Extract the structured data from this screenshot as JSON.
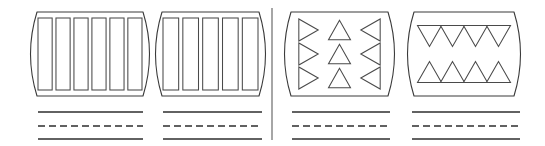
{
  "figure": {
    "title": "Four patterned barrel panels with caption rules",
    "canvas": {
      "width": 545,
      "height": 146
    },
    "background_color": "#ffffff",
    "outline_color": "#3a3a3a",
    "inner_shape_color": "#4a4a4a",
    "rule_color": "#2e2e2e",
    "divider_color": "#6b6b6b"
  },
  "divider": {
    "name": "center-divider",
    "orientation": "vertical",
    "x": 272,
    "y_start": 8,
    "y_end": 140
  },
  "groups": [
    {
      "id": "group-1",
      "panel": {
        "name": "barrel-panel-vertical-bars-six",
        "left": 33,
        "right": 147,
        "top": 12,
        "bottom": 96,
        "bulge": 9,
        "pattern": "vertical-bars",
        "count": 6
      },
      "rules": [
        {
          "style": "solid",
          "x1": 38,
          "x2": 143,
          "y": 112
        },
        {
          "style": "dashed",
          "x1": 38,
          "x2": 143,
          "y": 126
        },
        {
          "style": "solid",
          "x1": 38,
          "x2": 143,
          "y": 139
        }
      ]
    },
    {
      "id": "group-2",
      "panel": {
        "name": "barrel-panel-vertical-bars-five",
        "left": 158,
        "right": 263,
        "top": 12,
        "bottom": 96,
        "bulge": 9,
        "pattern": "vertical-bars",
        "count": 5
      },
      "rules": [
        {
          "style": "solid",
          "x1": 163,
          "x2": 262,
          "y": 112
        },
        {
          "style": "dashed",
          "x1": 163,
          "x2": 262,
          "y": 126
        },
        {
          "style": "solid",
          "x1": 163,
          "x2": 262,
          "y": 139
        }
      ]
    },
    {
      "id": "group-3",
      "panel": {
        "name": "barrel-panel-triangles-three-columns",
        "left": 287,
        "right": 392,
        "top": 12,
        "bottom": 96,
        "bulge": 9,
        "pattern": "triangle-columns",
        "columns": [
          {
            "direction": "right",
            "count": 3
          },
          {
            "direction": "up",
            "count": 3
          },
          {
            "direction": "left",
            "count": 3
          }
        ]
      },
      "rules": [
        {
          "style": "solid",
          "x1": 292,
          "x2": 390,
          "y": 112
        },
        {
          "style": "dashed",
          "x1": 292,
          "x2": 390,
          "y": 126
        },
        {
          "style": "solid",
          "x1": 292,
          "x2": 390,
          "y": 139
        }
      ]
    },
    {
      "id": "group-4",
      "panel": {
        "name": "barrel-panel-triangles-two-rows",
        "left": 410,
        "right": 518,
        "top": 12,
        "bottom": 96,
        "bulge": 9,
        "pattern": "triangle-rows",
        "rows": [
          {
            "direction": "down",
            "count": 4
          },
          {
            "direction": "up",
            "count": 4
          }
        ]
      },
      "rules": [
        {
          "style": "solid",
          "x1": 412,
          "x2": 520,
          "y": 112
        },
        {
          "style": "dashed",
          "x1": 412,
          "x2": 520,
          "y": 126
        },
        {
          "style": "solid",
          "x1": 412,
          "x2": 520,
          "y": 139
        }
      ]
    }
  ]
}
